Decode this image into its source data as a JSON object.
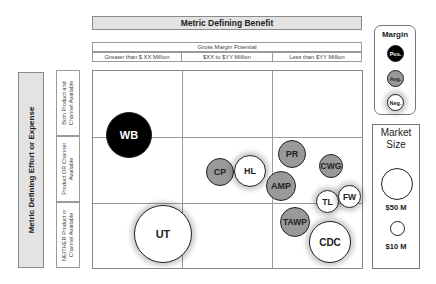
{
  "top_header": {
    "title": "Metric Defining Benefit"
  },
  "gross_margin": {
    "title": "Gross Margin Potential",
    "columns": [
      "Greater than  $ XX Million",
      "$XX to $YY Million",
      "Less than $YY Million"
    ]
  },
  "left_header": {
    "title": "Metric Defining Effort or Expense"
  },
  "rows": [
    "Both Product and Channel Available",
    "Product OR Channel Available",
    "NEITHER Product or Channel Available"
  ],
  "bubbles": [
    {
      "label": "WB",
      "margin": "Pos."
    },
    {
      "label": "CP",
      "margin": "Avg."
    },
    {
      "label": "HL",
      "margin": "Neg."
    },
    {
      "label": "PR",
      "margin": "Avg."
    },
    {
      "label": "CWG",
      "margin": "Avg."
    },
    {
      "label": "AMP",
      "margin": "Avg."
    },
    {
      "label": "TL",
      "margin": "Neg."
    },
    {
      "label": "FW",
      "margin": "Neg."
    },
    {
      "label": "TAWP",
      "margin": "Avg."
    },
    {
      "label": "UT",
      "margin": "Neg."
    },
    {
      "label": "CDC",
      "margin": "Neg."
    }
  ],
  "margin_legend": {
    "title": "Margin",
    "items": [
      "Pos.",
      "Avg.",
      "Neg."
    ]
  },
  "size_legend": {
    "title_line1": "Market",
    "title_line2": "Size",
    "items": [
      "$50 M",
      "$10 M"
    ]
  },
  "colors": {
    "positive": "#000000",
    "average": "#999999",
    "negative": "#ffffff",
    "header_fill": "#e3e3e3"
  }
}
